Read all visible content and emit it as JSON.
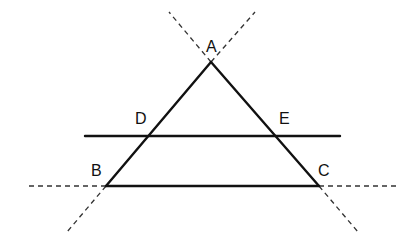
{
  "diagram": {
    "type": "geometry",
    "colors": {
      "stroke": "#111111",
      "background": "#ffffff"
    },
    "points": {
      "A": {
        "label": "A",
        "x": 211,
        "y": 62,
        "label_x": 206,
        "label_y": 52
      },
      "B": {
        "label": "B",
        "x": 106,
        "y": 186,
        "label_x": 91,
        "label_y": 176
      },
      "C": {
        "label": "C",
        "x": 319,
        "y": 186,
        "label_x": 318,
        "label_y": 176
      },
      "D": {
        "label": "D",
        "x": 148,
        "y": 136,
        "label_x": 135,
        "label_y": 124
      },
      "E": {
        "label": "E",
        "x": 275,
        "y": 136,
        "label_x": 279,
        "label_y": 124
      }
    },
    "solid_segments": [
      {
        "name": "AB",
        "from": "A",
        "to": "B"
      },
      {
        "name": "AC",
        "from": "A",
        "to": "C"
      },
      {
        "name": "BC",
        "from": "B",
        "to": "C"
      },
      {
        "name": "DE-line",
        "x1": 85,
        "y1": 136,
        "x2": 340,
        "y2": 136
      }
    ],
    "dashed_extensions": [
      {
        "name": "BA-extended-above-A",
        "x1": 211,
        "y1": 62,
        "x2": 169,
        "y2": 12
      },
      {
        "name": "CA-extended-above-A",
        "x1": 211,
        "y1": 62,
        "x2": 255,
        "y2": 12
      },
      {
        "name": "AB-extended-below-B",
        "x1": 106,
        "y1": 186,
        "x2": 67,
        "y2": 232
      },
      {
        "name": "AC-extended-below-C",
        "x1": 319,
        "y1": 186,
        "x2": 358,
        "y2": 232
      },
      {
        "name": "BC-extended-left",
        "x1": 106,
        "y1": 186,
        "x2": 27,
        "y2": 186
      },
      {
        "name": "BC-extended-right",
        "x1": 319,
        "y1": 186,
        "x2": 398,
        "y2": 186
      }
    ]
  }
}
